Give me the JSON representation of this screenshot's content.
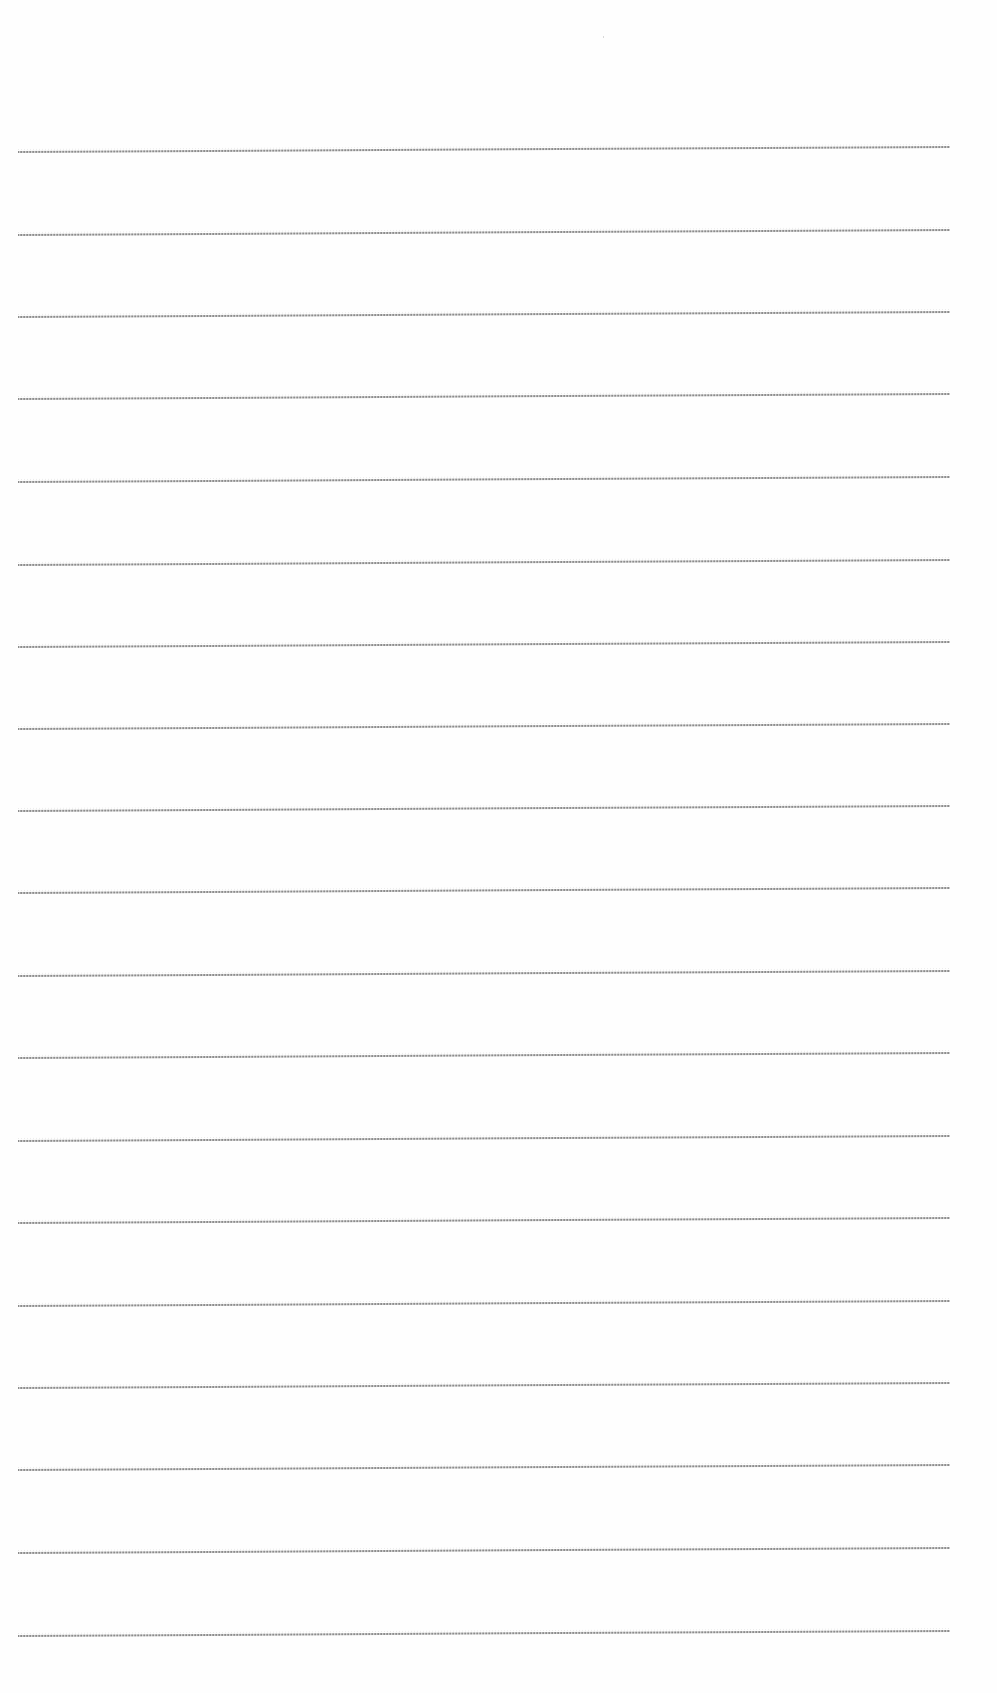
{
  "page": {
    "type": "blank ruled notebook page",
    "background_color": "#fefefe",
    "line_color": "#8c8c8c"
  },
  "ruled_lines": {
    "count": 19,
    "x_start": 18,
    "x_end": 950,
    "rise_px": 5,
    "y_positions": [
      152,
      235,
      317,
      399,
      482,
      565,
      647,
      729,
      811,
      893,
      976,
      1058,
      1141,
      1223,
      1306,
      1388,
      1470,
      1553,
      1636
    ]
  },
  "text_content": []
}
